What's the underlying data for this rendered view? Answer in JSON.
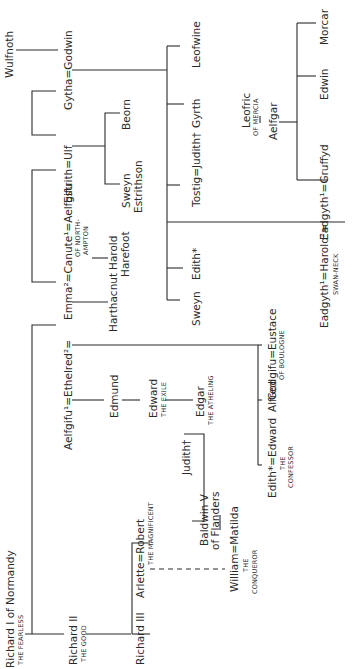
{
  "diagram": {
    "type": "genealogical-tree",
    "orientation": "rotated-90-ccw",
    "people": {
      "wulfnoth": "Wulfnoth",
      "gytha_godwin": "Gytha=Godwin",
      "estrith_ulf": "Estrith=Ulf",
      "beorn": "Beorn",
      "sweyn_estrithson_1": "Sweyn",
      "sweyn_estrithson_2": "Estrithson",
      "leofwine": "Leofwine",
      "gyrth": "Gyrth",
      "tostig_judith": "Tostig=Judith†",
      "edith": "Edith*",
      "sweyn": "Sweyn",
      "leofric": "Leofric",
      "leofric_epithet": "OF MERCIA",
      "aelfgar": "Aelfgar",
      "morcar": "Morcar",
      "edwin": "Edwin",
      "eadgyth_gruffyd": "Eadgyth¹=Gruffyd",
      "harold_marriage": "Eadgyth¹=Harold²=",
      "harold_epithet": "SWAN-NECK",
      "canute_marriage": "Emma²=Canute¹=Aelfgifu",
      "aelfgifu_epithet_1": "OF NORTH-",
      "aelfgifu_epithet_2": "AMPTON",
      "harthacnut": "Harthacnut",
      "harold_harefoot_1": "Harold",
      "harold_harefoot_2": "Harefoot",
      "ethelred_marriage": "Aelfgifu¹=Ethelred²=",
      "edmund": "Edmund",
      "edward_exile": "Edward",
      "edward_exile_epithet": "THE EXILE",
      "edgar": "Edgar",
      "edgar_epithet": "THE ATHELING",
      "godgifu_eustace": "Godgifu=Eustace",
      "eustace_epithet": "OF BOULOGNE",
      "alfred": "Alfred",
      "edith_edward": "Edith*=Edward",
      "confessor_epithet_1": "THE",
      "confessor_epithet_2": "CONFESSOR",
      "judith": "Judith†",
      "baldwin_1": "Baldwin V",
      "baldwin_2": "of Flanders",
      "william_matilda": "William=Matilda",
      "william_epithet_1": "THE",
      "william_epithet_2": "CONQUEROR",
      "richard1": "Richard I of Normandy",
      "richard1_epithet": "THE FEARLESS",
      "richard2": "Richard II",
      "richard2_epithet": "THE GOOD",
      "richard3": "Richard III",
      "arlette_robert": "Arlette=Robert",
      "robert_epithet": "THE MAGNIFICENT"
    }
  }
}
